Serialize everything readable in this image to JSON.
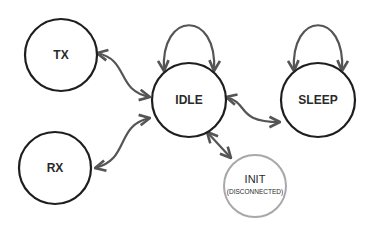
{
  "diagram": {
    "type": "state-machine",
    "colors": {
      "node_stroke": "#1e1e1e",
      "inactive_node_stroke": "#a8a8a8",
      "edge": "#555555",
      "background": "#ffffff"
    },
    "nodes": [
      {
        "id": "tx",
        "label": "TX"
      },
      {
        "id": "rx",
        "label": "RX"
      },
      {
        "id": "idle",
        "label": "IDLE"
      },
      {
        "id": "sleep",
        "label": "SLEEP"
      },
      {
        "id": "init",
        "label": "INIT",
        "sublabel": "(DISCONNECTED)"
      }
    ],
    "edges": [
      {
        "from": "idle",
        "to": "idle",
        "type": "self-loop"
      },
      {
        "from": "sleep",
        "to": "sleep",
        "type": "self-loop"
      },
      {
        "from": "tx",
        "to": "idle",
        "type": "bidirectional"
      },
      {
        "from": "rx",
        "to": "idle",
        "type": "bidirectional"
      },
      {
        "from": "idle",
        "to": "sleep",
        "type": "bidirectional"
      },
      {
        "from": "idle",
        "to": "init",
        "type": "bidirectional"
      }
    ]
  }
}
